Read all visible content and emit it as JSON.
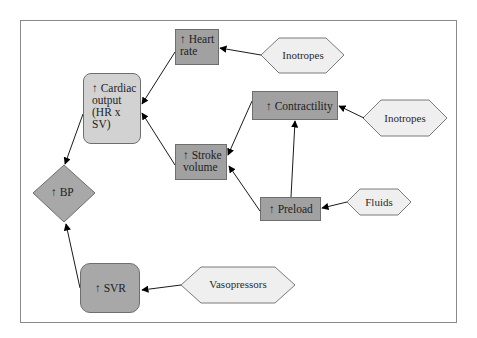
{
  "diagram": {
    "title": "",
    "nodes": {
      "heart_rate": {
        "label": "↑ Heart\nrate",
        "shape": "rect",
        "fill": "#a1a1a1"
      },
      "cardiac_output": {
        "label": "↑ Cardiac\noutput\n(HR x\nSV)",
        "shape": "rounded-rect",
        "fill": "#d2d2d2"
      },
      "stroke_volume": {
        "label": "↑ Stroke\nvolume",
        "shape": "rect",
        "fill": "#a1a1a1"
      },
      "contractility": {
        "label": "↑ Contractility",
        "shape": "rect",
        "fill": "#a1a1a1"
      },
      "preload": {
        "label": "↑ Preload",
        "shape": "rect",
        "fill": "#a1a1a1"
      },
      "bp": {
        "label": "↑ BP",
        "shape": "diamond",
        "fill": "#a8a8a8"
      },
      "svr": {
        "label": "↑ SVR",
        "shape": "rounded-rect",
        "fill": "#a8a8a8"
      },
      "inotropes_top": {
        "label": "Inotropes",
        "shape": "hexagon",
        "fill": "#efefef"
      },
      "inotropes_right": {
        "label": "Inotropes",
        "shape": "hexagon",
        "fill": "#efefef"
      },
      "fluids": {
        "label": "Fluids",
        "shape": "hexagon",
        "fill": "#efefef"
      },
      "vasopressors": {
        "label": "Vasopressors",
        "shape": "hexagon",
        "fill": "#efefef"
      }
    },
    "edges": [
      {
        "from": "inotropes_top",
        "to": "heart_rate"
      },
      {
        "from": "heart_rate",
        "to": "cardiac_output"
      },
      {
        "from": "stroke_volume",
        "to": "cardiac_output"
      },
      {
        "from": "contractility",
        "to": "stroke_volume"
      },
      {
        "from": "preload",
        "to": "stroke_volume"
      },
      {
        "from": "preload",
        "to": "contractility"
      },
      {
        "from": "inotropes_right",
        "to": "contractility"
      },
      {
        "from": "fluids",
        "to": "preload"
      },
      {
        "from": "cardiac_output",
        "to": "bp"
      },
      {
        "from": "svr",
        "to": "bp"
      },
      {
        "from": "vasopressors",
        "to": "svr"
      }
    ]
  }
}
